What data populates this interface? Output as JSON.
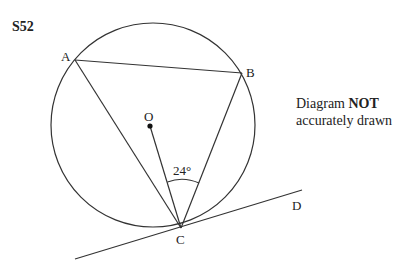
{
  "question": {
    "id": "S52"
  },
  "diagram": {
    "points": {
      "A": "A",
      "B": "B",
      "C": "C",
      "D": "D",
      "O": "O"
    },
    "angle_label": "24°",
    "note_line1_prefix": "Diagram ",
    "note_line1_bold": "NOT",
    "note_line2": "accurately drawn",
    "line_color": "#333333"
  }
}
